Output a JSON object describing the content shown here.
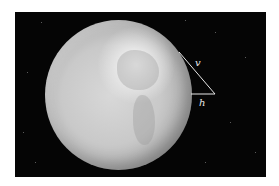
{
  "figure": {
    "background_color": "#050505",
    "globe_color": "#c9c9c9",
    "line_color": "#e8e8e8",
    "labels": {
      "v": "v",
      "h": "h"
    }
  }
}
